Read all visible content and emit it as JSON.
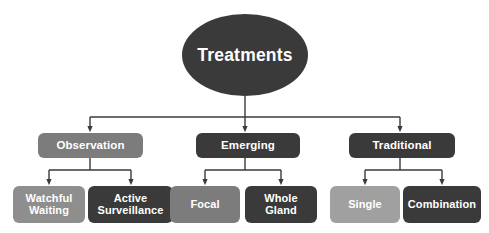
{
  "diagram": {
    "type": "hierarchy-tree",
    "title": "Treatments",
    "palette": {
      "dark": "#3a3a3a",
      "mid": "#7c7c7c",
      "light": "#a8a8a8",
      "text": "#ffffff",
      "connector": "#3a3a3a",
      "background": "#ffffff"
    },
    "root": {
      "label": "Treatments",
      "shape": "ellipse",
      "fill": "#3a3a3a"
    },
    "categories": [
      {
        "label": "Observation",
        "fill": "#7c7c7c",
        "children": [
          {
            "label": "Watchful\nWaiting",
            "fill": "#8e8e8e"
          },
          {
            "label": "Active\nSurveillance",
            "fill": "#3a3a3a"
          }
        ]
      },
      {
        "label": "Emerging",
        "fill": "#3a3a3a",
        "children": [
          {
            "label": "Focal",
            "fill": "#7c7c7c"
          },
          {
            "label": "Whole\nGland",
            "fill": "#3a3a3a"
          }
        ]
      },
      {
        "label": "Traditional",
        "fill": "#3a3a3a",
        "children": [
          {
            "label": "Single",
            "fill": "#a0a0a0"
          },
          {
            "label": "Combination",
            "fill": "#3a3a3a"
          }
        ]
      }
    ]
  }
}
